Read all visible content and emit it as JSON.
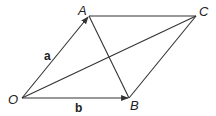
{
  "diagram": {
    "title": "",
    "points": {
      "O": {
        "label": "O",
        "x": 22,
        "y": 98
      },
      "A": {
        "label": "A",
        "x": 89,
        "y": 16
      },
      "B": {
        "label": "B",
        "x": 129,
        "y": 98
      },
      "C": {
        "label": "C",
        "x": 196,
        "y": 16
      }
    },
    "vectors": {
      "a": {
        "label": "a",
        "from": "O",
        "to": "A"
      },
      "b": {
        "label": "b",
        "from": "O",
        "to": "B"
      }
    },
    "segments": [
      "OA",
      "OB",
      "AC",
      "BC",
      "OC",
      "AB"
    ],
    "colors": {
      "stroke": "#333333",
      "text": "#222222",
      "background": "#ffffff"
    }
  }
}
